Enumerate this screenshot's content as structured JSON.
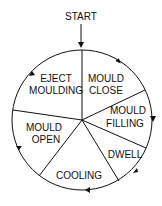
{
  "start_label": "START",
  "segments": [
    {
      "line1": "MOULD",
      "line2": "CLOSE"
    },
    {
      "line1": "MOULD",
      "line2": "FILLING"
    },
    {
      "line1": "DWELL",
      "line2": ""
    },
    {
      "line1": "COOLING",
      "line2": ""
    },
    {
      "line1": "MOULD",
      "line2": "OPEN"
    },
    {
      "line1": "EJECT",
      "line2": "MOULDING"
    }
  ],
  "colors": {
    "stroke": "#111111",
    "background": "#ffffff"
  }
}
